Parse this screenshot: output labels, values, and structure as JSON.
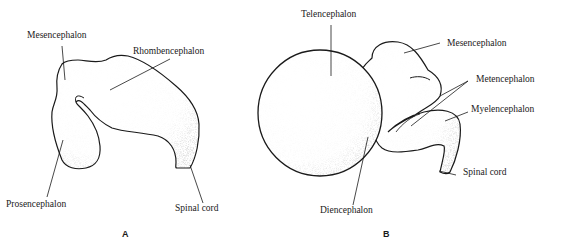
{
  "figure": {
    "panel_a": {
      "letter": "A",
      "labels": {
        "mesencephalon": "Mesencephalon",
        "rhombencephalon": "Rhombencephalon",
        "prosencephalon": "Prosencephalon",
        "spinal_cord": "Spinal cord"
      }
    },
    "panel_b": {
      "letter": "B",
      "labels": {
        "telencephalon": "Telencephalon",
        "mesencephalon": "Mesencephalon",
        "metencephalon": "Metencephalon",
        "myelencephalon": "Myelencephalon",
        "spinal_cord": "Spinal cord",
        "diencephalon": "Diencephalon"
      }
    },
    "colors": {
      "ink": "#1a1a1a",
      "background": "#ffffff"
    }
  }
}
